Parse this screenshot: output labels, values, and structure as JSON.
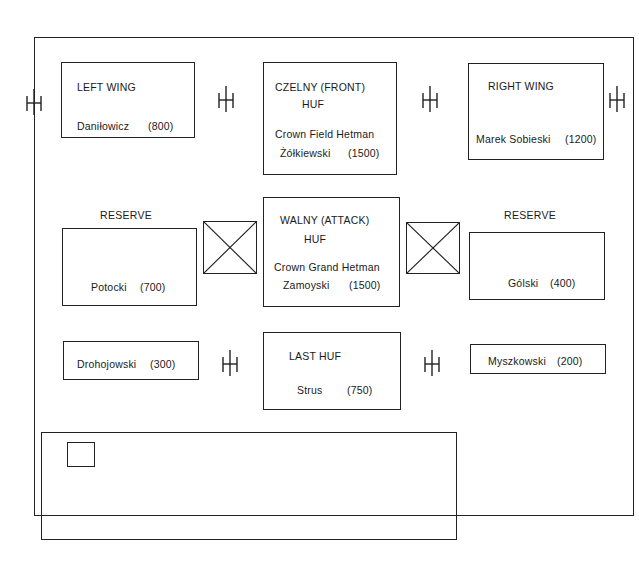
{
  "diagram": {
    "units": {
      "left_wing": {
        "title": "LEFT WING",
        "commander": "Daniłowicz",
        "strength": "(800)"
      },
      "front_huf": {
        "title_line1": "CZELNY (FRONT)",
        "title_line2": "HUF",
        "commander_line1": "Crown Field Hetman",
        "commander_line2": "Żółkiewski",
        "strength": "(1500)"
      },
      "right_wing": {
        "title": "RIGHT WING",
        "commander": "Marek Sobieski",
        "strength": "(1200)"
      },
      "left_reserve": {
        "label": "RESERVE",
        "commander": "Potocki",
        "strength": "(700)"
      },
      "attack_huf": {
        "title_line1": "WALNY  (ATTACK)",
        "title_line2": "HUF",
        "commander_line1": "Crown Grand Hetman",
        "commander_line2": "Zamoyski",
        "strength": "(1500)"
      },
      "right_reserve": {
        "label": "RESERVE",
        "commander": "Gólski",
        "strength": "(400)"
      },
      "left_rear": {
        "commander": "Drohojowski",
        "strength": "(300)"
      },
      "last_huf": {
        "title": "LAST HUF",
        "commander": "Strus",
        "strength": "(750)"
      },
      "right_rear": {
        "commander": "Myszkowski",
        "strength": "(200)"
      }
    },
    "legend": {
      "cavalry": "Cavalry Huf  or Pułk  – mixed hussars &  ‘cossacks’",
      "infantry": "Mainly  Haiduk style  infantry –  total  2000 men",
      "artillery": "Artillery  –  total  40  guns"
    }
  }
}
